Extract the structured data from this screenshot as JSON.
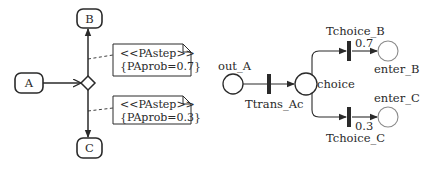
{
  "activity_diagram": {
    "nodes": {
      "A": "A",
      "B": "B",
      "C": "C"
    },
    "decision": "decision-node",
    "notes": [
      {
        "stereotype": "<<PAstep>>",
        "tag": "{PAprob=0.7}"
      },
      {
        "stereotype": "<<PAstep>>",
        "tag": "{PAprob=0.3}"
      }
    ]
  },
  "petri_net": {
    "places": {
      "out_A": "out_A",
      "choice": "choice",
      "enter_B": "enter_B",
      "enter_C": "enter_C"
    },
    "transitions": {
      "Ttrans_Ac": "Ttrans_Ac",
      "Tchoice_B": "Tchoice_B",
      "Tchoice_C": "Tchoice_C"
    },
    "weights": {
      "Tchoice_B": "0.7",
      "Tchoice_C": "0.3"
    }
  },
  "colors": {
    "stroke": "#2a2a2a",
    "light_stroke": "#8a8a8a",
    "background": "#ffffff"
  }
}
